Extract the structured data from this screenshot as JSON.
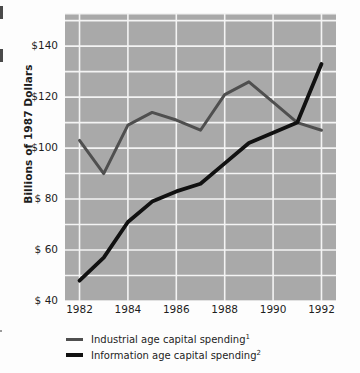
{
  "chart_data": {
    "type": "line",
    "title": "",
    "xlabel": "",
    "ylabel": "Billions of 1987 Dollars",
    "x": [
      1982,
      1983,
      1984,
      1985,
      1986,
      1987,
      1988,
      1989,
      1990,
      1991,
      1992
    ],
    "xtick_labels": [
      "1982",
      "1984",
      "1986",
      "1988",
      "1990",
      "1992"
    ],
    "xtick_values": [
      1982,
      1984,
      1986,
      1988,
      1990,
      1992
    ],
    "ytick_labels": [
      "$140",
      "$120",
      "$100",
      "$ 80",
      "$ 60",
      "$ 40"
    ],
    "ytick_values": [
      140,
      120,
      100,
      80,
      60,
      40
    ],
    "ylim": [
      40,
      153
    ],
    "xlim": [
      1981.4,
      1992.6
    ],
    "grid": true,
    "grid_interval": 10,
    "grid_color": "#f4f4f4",
    "plot_background": "#a9a9a9",
    "legend_position": "below",
    "series": [
      {
        "name": "Industrial age capital spending¹",
        "label_text": "Industrial age capital spending",
        "footnote": "1",
        "color": "#4f4f4f",
        "values": [
          103,
          90,
          109,
          114,
          111,
          107,
          121,
          126,
          118,
          110,
          107
        ]
      },
      {
        "name": "Information age capital spending²",
        "label_text": "Information age capital spending",
        "footnote": "2",
        "color": "#111111",
        "values": [
          48,
          57,
          71,
          79,
          83,
          86,
          94,
          102,
          106,
          110,
          133
        ]
      }
    ]
  },
  "axis": {
    "y_title": "Billions of 1987 Dollars"
  },
  "legend": {
    "items": [
      {
        "label": "Industrial age capital spending",
        "footnote": "1",
        "color": "#4f4f4f"
      },
      {
        "label": "Information age capital spending",
        "footnote": "2",
        "color": "#111111"
      }
    ]
  }
}
